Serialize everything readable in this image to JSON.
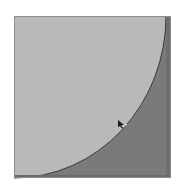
{
  "diagram": {
    "type": "quarter-circle-in-square",
    "square": {
      "x": 14,
      "y": 16,
      "width": 157,
      "height": 162
    },
    "arc": {
      "center": "bottom-left",
      "radius": "square-width"
    },
    "colors": {
      "background": "#ffffff",
      "inner_fill": "#b9b9b9",
      "outer_fill": "#7a7a7a",
      "arc_stroke": "#3a3a3a",
      "border": "#8c8c8c",
      "marker": "#1a1a1a"
    },
    "marker": {
      "icon": "pointer-cursor-icon",
      "x": 121,
      "y": 124
    }
  }
}
